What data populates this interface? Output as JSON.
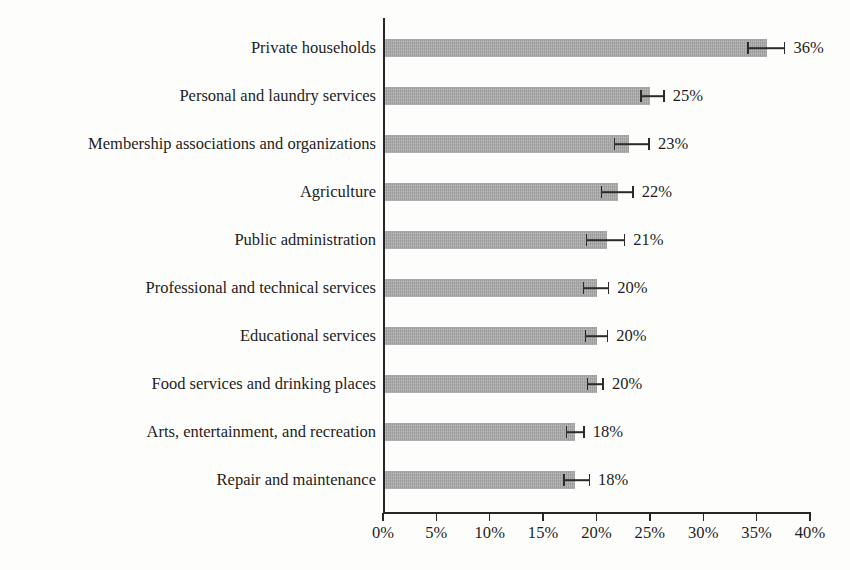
{
  "chart_data": {
    "type": "bar",
    "orientation": "horizontal",
    "title": "",
    "subtitle": "",
    "xlabel": "",
    "ylabel": "",
    "xlim": [
      0,
      40
    ],
    "x_tick_labels": [
      "0%",
      "5%",
      "10%",
      "15%",
      "20%",
      "25%",
      "30%",
      "35%",
      "40%"
    ],
    "x_tick_values": [
      0,
      5,
      10,
      15,
      20,
      25,
      30,
      35,
      40
    ],
    "grid": false,
    "legend": "none",
    "units": "percent",
    "bar_color": "#a9a9a9",
    "axis_color": "#262626",
    "text_color": "#1d1d1d",
    "categories": [
      "Private households",
      "Personal and laundry services",
      "Membership associations and organizations",
      "Agriculture",
      "Public administration",
      "Professional and technical services",
      "Educational services",
      "Food services and drinking places",
      "Arts, entertainment, and recreation",
      "Repair and maintenance"
    ],
    "values": [
      36,
      25,
      23,
      22,
      21,
      20,
      20,
      20,
      18,
      18
    ],
    "value_labels": [
      "36%",
      "25%",
      "23%",
      "22%",
      "21%",
      "20%",
      "20%",
      "20%",
      "18%",
      "18%"
    ],
    "error_low": [
      34.1,
      24.1,
      21.6,
      20.4,
      19.0,
      18.7,
      18.9,
      19.1,
      17.1,
      16.9
    ],
    "error_high": [
      37.7,
      26.4,
      25.0,
      23.5,
      22.7,
      21.2,
      21.1,
      20.7,
      18.9,
      19.4
    ],
    "series": [
      {
        "name": "Share",
        "values": [
          36,
          25,
          23,
          22,
          21,
          20,
          20,
          20,
          18,
          18
        ]
      }
    ]
  }
}
